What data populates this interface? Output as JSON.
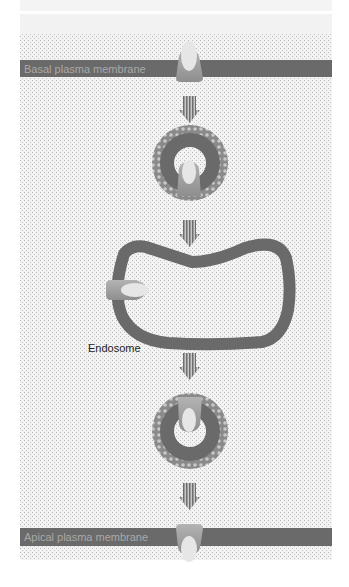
{
  "diagram": {
    "labels": {
      "basal": "Basal plasma membrane",
      "apical": "Apical plasma membrane",
      "endosome": "Endosome"
    },
    "colors": {
      "background_stipple": "#e9e9e9",
      "membrane": "#6a6a6a",
      "membrane_text": "#a9a9a9",
      "protein_body": "#9a9a9a",
      "protein_highlight": "#e4e4e4",
      "vesicle_coat": "#8a8a8a",
      "arrow": "#7a7a7a",
      "label_text": "#222222"
    },
    "steps": [
      "Protein in basal plasma membrane",
      "Coated vesicle (endocytosis)",
      "Endosome",
      "Coated vesicle (exocytosis)",
      "Protein in apical plasma membrane"
    ]
  }
}
